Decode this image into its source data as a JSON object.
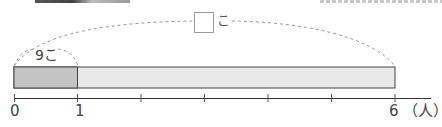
{
  "diagram": {
    "type": "tape-diagram",
    "top_arc": {
      "blank_box": "",
      "unit": "こ"
    },
    "part_arc": {
      "value": "9",
      "unit": "こ",
      "label": "9こ"
    },
    "bar": {
      "total_segments": 6,
      "shaded_segments": 1,
      "shaded_color": "#c4c4c4",
      "unshaded_color": "#e8e8e8",
      "border_color": "#444444"
    },
    "axis": {
      "tick_labels": [
        {
          "position": 0,
          "label": "0"
        },
        {
          "position": 1,
          "label": "1"
        },
        {
          "position": 6,
          "label": "6"
        }
      ],
      "tick_count": 7,
      "unit_label": "（人）"
    }
  }
}
